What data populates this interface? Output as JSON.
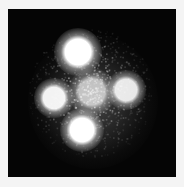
{
  "image": {
    "description": "Grayscale image of a quadruply lensed quasar (cross pattern): four bright point-like images surrounding a fainter central source on a black background, with diffuse speckled glow",
    "background_color": "#050505",
    "border_color": "#f4f4f4",
    "sources": [
      {
        "name": "top",
        "x": 70,
        "y": 43,
        "radius": 11,
        "brightness": 1.0
      },
      {
        "name": "left",
        "x": 46,
        "y": 89,
        "radius": 9,
        "brightness": 0.95
      },
      {
        "name": "center",
        "x": 84,
        "y": 83,
        "radius": 11,
        "brightness": 0.7
      },
      {
        "name": "right",
        "x": 118,
        "y": 81,
        "radius": 9,
        "brightness": 0.9
      },
      {
        "name": "bottom",
        "x": 74,
        "y": 121,
        "radius": 10,
        "brightness": 1.0
      }
    ]
  }
}
